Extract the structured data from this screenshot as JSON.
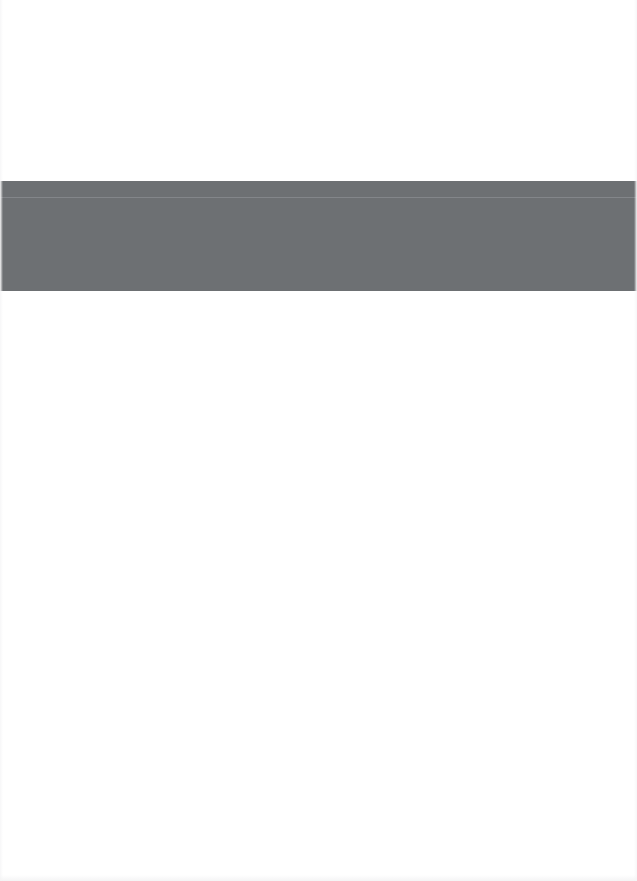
{
  "page": {
    "background_color": "#ffffff",
    "width": 637,
    "height": 881
  },
  "band": {
    "label": "",
    "color": "#6d7073",
    "divider_color": "#83868a",
    "top": 181,
    "height": 110,
    "strip_height": 16,
    "left_slot_text": "",
    "center_slot_text": "",
    "right_slot_text": ""
  },
  "regions": {
    "top_blank_text": "",
    "bottom_blank_text": ""
  }
}
